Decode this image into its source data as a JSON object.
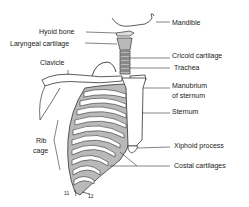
{
  "figure": {
    "labels": {
      "mandible": "Mandible",
      "hyoid_bone": "Hyoid bone",
      "laryngeal_cartilage": "Laryngeal cartilage",
      "cricoid_cartilage": "Cricoid cartilage",
      "trachea": "Trachea",
      "clavicle": "Clavicle",
      "manubrium_line1": "Manubrium",
      "manubrium_line2": "of sternum",
      "sternum": "Sternum",
      "rib_cage_line1": "Rib",
      "rib_cage_line2": "cage",
      "xiphoid_process": "Xiphoid process",
      "costal_cartilages": "Costal cartilages",
      "rib_11": "11",
      "rib_12": "12"
    },
    "colors": {
      "line": "#333333",
      "bone_fill": "#ffffff",
      "cartilage_fill": "#b9b9b9"
    }
  }
}
